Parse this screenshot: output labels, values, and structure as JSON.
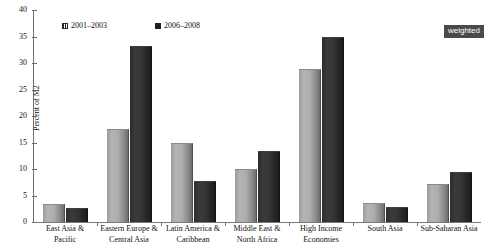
{
  "badge": {
    "label": "weighted"
  },
  "chart_data": {
    "type": "bar",
    "title": "",
    "xlabel": "",
    "ylabel": "Percent of M2",
    "ylim": [
      0,
      40
    ],
    "yticks": [
      0,
      5,
      10,
      15,
      20,
      25,
      30,
      35,
      40
    ],
    "grid": false,
    "legend_position": "top-left",
    "categories": [
      "East Asia &\nPacific",
      "Eastern Europe &\nCentral Asia",
      "Latin America &\nCaribbean",
      "Middle East &\nNorth Africa",
      "High Income\nEconomies",
      "South Asia",
      "Sub-Saharan Asia"
    ],
    "series": [
      {
        "name": "2001–2003",
        "color": "#a8a8a8",
        "values": [
          3.2,
          17.3,
          14.8,
          9.9,
          28.7,
          3.4,
          6.9
        ]
      },
      {
        "name": "2006–2008",
        "color": "#2b2b2b",
        "values": [
          2.5,
          33.0,
          7.6,
          13.3,
          34.7,
          2.6,
          9.2
        ]
      }
    ]
  }
}
